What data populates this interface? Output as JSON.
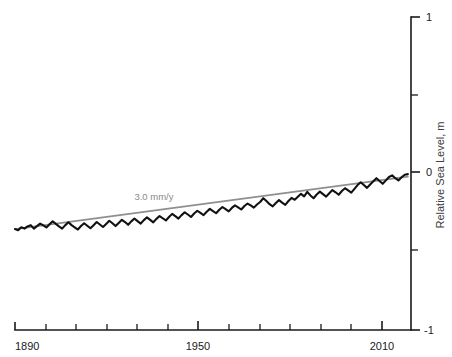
{
  "chart_data": {
    "type": "line",
    "title": "",
    "subtitle": "",
    "xlabel": "",
    "ylabel": "Relative Sea Level, m",
    "xlim": [
      1890,
      2016
    ],
    "ylim": [
      -1,
      1
    ],
    "grid": false,
    "legend_position": "none",
    "x_ticks_major": [
      1890,
      1950,
      2010
    ],
    "x_tick_labels": [
      "1890",
      "1950",
      "2010"
    ],
    "x_ticks_minor": [
      1900,
      1910,
      1920,
      1930,
      1940,
      1960,
      1970,
      1980,
      1990,
      2000
    ],
    "y_ticks_major": [
      -1,
      0,
      1
    ],
    "y_tick_labels": [
      "-1",
      "0",
      "1"
    ],
    "y_ticks_minor": [
      -0.5,
      0.5
    ],
    "annotations": [
      {
        "text": "3.0 mm/y",
        "x": 1928,
        "y": -0.17,
        "color": "#8a8a8a"
      }
    ],
    "series": [
      {
        "name": "Relative sea level",
        "color": "#111111",
        "style": "solid-jagged",
        "x": [
          1890,
          1891,
          1892,
          1893,
          1894,
          1895,
          1896,
          1897,
          1898,
          1899,
          1900,
          1901,
          1902,
          1903,
          1904,
          1905,
          1906,
          1907,
          1908,
          1909,
          1910,
          1911,
          1912,
          1913,
          1914,
          1915,
          1916,
          1917,
          1918,
          1919,
          1920,
          1921,
          1922,
          1923,
          1924,
          1925,
          1926,
          1927,
          1928,
          1929,
          1930,
          1931,
          1932,
          1933,
          1934,
          1935,
          1936,
          1937,
          1938,
          1939,
          1940,
          1941,
          1942,
          1943,
          1944,
          1945,
          1946,
          1947,
          1948,
          1949,
          1950,
          1951,
          1952,
          1953,
          1954,
          1955,
          1956,
          1957,
          1958,
          1959,
          1960,
          1961,
          1962,
          1963,
          1964,
          1965,
          1966,
          1967,
          1968,
          1969,
          1970,
          1971,
          1972,
          1973,
          1974,
          1975,
          1976,
          1977,
          1978,
          1979,
          1980,
          1981,
          1982,
          1983,
          1984,
          1985,
          1986,
          1987,
          1988,
          1989,
          1990,
          1991,
          1992,
          1993,
          1994,
          1995,
          1996,
          1997,
          1998,
          1999,
          2000,
          2001,
          2002,
          2003,
          2004,
          2005,
          2006,
          2007,
          2008,
          2009,
          2010,
          2011,
          2012,
          2013,
          2014,
          2015
        ],
        "values": [
          -0.355,
          -0.362,
          -0.344,
          -0.352,
          -0.338,
          -0.33,
          -0.352,
          -0.336,
          -0.32,
          -0.332,
          -0.345,
          -0.325,
          -0.305,
          -0.322,
          -0.338,
          -0.352,
          -0.33,
          -0.312,
          -0.33,
          -0.344,
          -0.358,
          -0.336,
          -0.318,
          -0.334,
          -0.35,
          -0.33,
          -0.31,
          -0.326,
          -0.342,
          -0.322,
          -0.302,
          -0.318,
          -0.336,
          -0.316,
          -0.296,
          -0.31,
          -0.328,
          -0.306,
          -0.288,
          -0.304,
          -0.32,
          -0.298,
          -0.28,
          -0.296,
          -0.312,
          -0.29,
          -0.272,
          -0.286,
          -0.3,
          -0.278,
          -0.258,
          -0.272,
          -0.288,
          -0.266,
          -0.248,
          -0.262,
          -0.278,
          -0.256,
          -0.238,
          -0.252,
          -0.266,
          -0.244,
          -0.226,
          -0.24,
          -0.254,
          -0.232,
          -0.214,
          -0.228,
          -0.242,
          -0.22,
          -0.204,
          -0.216,
          -0.23,
          -0.208,
          -0.192,
          -0.204,
          -0.218,
          -0.198,
          -0.182,
          -0.158,
          -0.176,
          -0.196,
          -0.21,
          -0.188,
          -0.17,
          -0.186,
          -0.2,
          -0.176,
          -0.156,
          -0.168,
          -0.148,
          -0.13,
          -0.146,
          -0.118,
          -0.14,
          -0.158,
          -0.134,
          -0.116,
          -0.132,
          -0.148,
          -0.126,
          -0.106,
          -0.12,
          -0.136,
          -0.112,
          -0.094,
          -0.108,
          -0.122,
          -0.098,
          -0.074,
          -0.056,
          -0.074,
          -0.092,
          -0.07,
          -0.05,
          -0.03,
          -0.048,
          -0.066,
          -0.044,
          -0.022,
          -0.012,
          -0.03,
          -0.044,
          -0.024,
          -0.008,
          -0.004
        ]
      },
      {
        "name": "Linear trend 3.0 mm/y",
        "color": "#8f8f8f",
        "style": "solid-straight",
        "x": [
          1890,
          2015
        ],
        "values": [
          -0.355,
          -0.02
        ]
      }
    ]
  },
  "axes": {
    "y_axis_title": "Relative Sea Level, m",
    "y_axis_position": "right",
    "x_axis_position": "bottom"
  },
  "labels": {
    "x_1890": "1890",
    "x_1950": "1950",
    "x_2010": "2010",
    "y_top": "1",
    "y_mid": "0",
    "y_bottom": "-1",
    "trend_annotation": "3.0 mm/y",
    "y_axis_title": "Relative Sea Level, m"
  },
  "colors": {
    "series": "#111111",
    "trend": "#8f8f8f",
    "axis": "#1a1a1a",
    "annotation": "#8a8a8a",
    "background": "#ffffff"
  }
}
